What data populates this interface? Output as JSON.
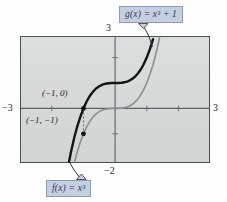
{
  "figure": {
    "background_color": "#d9dbdb",
    "frame_color": "#4a4f52",
    "label_box_fill": "#c5cfe2",
    "label_box_border": "#8e9cb4",
    "label_text_color": "#2c3a55"
  },
  "labels": {
    "g_function": "g(x)  =  x³ + 1",
    "f_function": "f(x)  =  x³",
    "point_upper": "(−1, 0)",
    "point_lower": "(−1, −1)"
  },
  "axes": {
    "x_left_tick": "−3",
    "x_right_tick": "3",
    "y_top_tick": "3",
    "y_bottom_tick": "−2"
  },
  "chart_data": {
    "type": "line",
    "title": "",
    "xlabel": "",
    "ylabel": "",
    "xlim": [
      -3,
      3
    ],
    "ylim": [
      -2,
      3
    ],
    "grid": false,
    "legend_position": "callout-boxes",
    "x_ticks": [
      -3,
      3
    ],
    "y_ticks": [
      -2,
      3
    ],
    "annotations": [
      {
        "text": "(−1, 0)",
        "x": -1,
        "y": 0,
        "marker": true,
        "series": "g"
      },
      {
        "text": "(−1, −1)",
        "x": -1,
        "y": -1,
        "marker": true,
        "series": "f"
      }
    ],
    "series": [
      {
        "name": "f(x) = x³",
        "color": "#8c8c8c",
        "style": "solid",
        "width": 1.6,
        "equation": "y = x^3",
        "x": [
          -1.5,
          -1.4,
          -1.3,
          -1.2,
          -1.1,
          -1.0,
          -0.9,
          -0.8,
          -0.7,
          -0.6,
          -0.5,
          -0.4,
          -0.3,
          -0.2,
          -0.1,
          0.0,
          0.1,
          0.2,
          0.3,
          0.4,
          0.5,
          0.6,
          0.7,
          0.8,
          0.9,
          1.0,
          1.1,
          1.2,
          1.3,
          1.4,
          1.5
        ],
        "y": [
          -3.375,
          -2.744,
          -2.197,
          -1.728,
          -1.331,
          -1.0,
          -0.729,
          -0.512,
          -0.343,
          -0.216,
          -0.125,
          -0.064,
          -0.027,
          -0.008,
          -0.001,
          0.0,
          0.001,
          0.008,
          0.027,
          0.064,
          0.125,
          0.216,
          0.343,
          0.512,
          0.729,
          1.0,
          1.331,
          1.728,
          2.197,
          2.744,
          3.375
        ]
      },
      {
        "name": "g(x) = x³ + 1",
        "color": "#141414",
        "style": "solid",
        "width": 2.4,
        "equation": "y = x^3 + 1",
        "x": [
          -1.6,
          -1.5,
          -1.4,
          -1.3,
          -1.2,
          -1.1,
          -1.0,
          -0.9,
          -0.8,
          -0.7,
          -0.6,
          -0.5,
          -0.4,
          -0.3,
          -0.2,
          -0.1,
          0.0,
          0.1,
          0.2,
          0.3,
          0.4,
          0.5,
          0.6,
          0.7,
          0.8,
          0.9,
          1.0,
          1.1,
          1.2
        ],
        "y": [
          -3.096,
          -2.375,
          -1.744,
          -1.197,
          -0.728,
          -0.331,
          0.0,
          0.271,
          0.488,
          0.657,
          0.784,
          0.875,
          0.936,
          0.973,
          0.992,
          0.999,
          1.0,
          1.001,
          1.008,
          1.027,
          1.064,
          1.125,
          1.216,
          1.343,
          1.512,
          1.729,
          2.0,
          2.331,
          2.728
        ]
      }
    ]
  }
}
